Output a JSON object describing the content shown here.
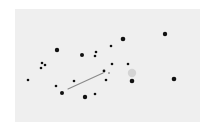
{
  "board": {
    "background": "#efefef",
    "x": 15,
    "y": 9,
    "width": 185,
    "height": 113
  },
  "colors": {
    "dot": "#111111",
    "line": "#8a8a8a",
    "highlight": "#d4d4d4",
    "cursor_dot": "#9a9a9a"
  },
  "dots": [
    {
      "x": 57,
      "y": 50,
      "r": 2.2
    },
    {
      "x": 82,
      "y": 55,
      "r": 2.0
    },
    {
      "x": 123,
      "y": 39,
      "r": 2.3
    },
    {
      "x": 165,
      "y": 34,
      "r": 2.2
    },
    {
      "x": 132,
      "y": 81,
      "r": 2.3
    },
    {
      "x": 174,
      "y": 79,
      "r": 2.3
    },
    {
      "x": 62,
      "y": 93,
      "r": 2.0
    },
    {
      "x": 85,
      "y": 97,
      "r": 2.2
    },
    {
      "x": 42,
      "y": 63,
      "r": 1.3
    },
    {
      "x": 45,
      "y": 65,
      "r": 1.3
    },
    {
      "x": 41,
      "y": 68,
      "r": 1.3
    },
    {
      "x": 28,
      "y": 80,
      "r": 1.3
    },
    {
      "x": 56,
      "y": 86,
      "r": 1.3
    },
    {
      "x": 74,
      "y": 81,
      "r": 1.3
    },
    {
      "x": 96,
      "y": 52,
      "r": 1.3
    },
    {
      "x": 95,
      "y": 56,
      "r": 1.3
    },
    {
      "x": 111,
      "y": 46,
      "r": 1.3
    },
    {
      "x": 112,
      "y": 64,
      "r": 1.3
    },
    {
      "x": 128,
      "y": 64,
      "r": 1.3
    },
    {
      "x": 104,
      "y": 71,
      "r": 1.4
    },
    {
      "x": 106,
      "y": 80,
      "r": 1.3
    },
    {
      "x": 95,
      "y": 94,
      "r": 1.3
    }
  ],
  "cursor_dot": {
    "x": 109,
    "y": 73,
    "r": 1.0
  },
  "highlight": {
    "x": 132,
    "y": 73,
    "r": 4.2
  },
  "line": {
    "x1": 68,
    "y1": 89,
    "x2": 103,
    "y2": 73
  }
}
